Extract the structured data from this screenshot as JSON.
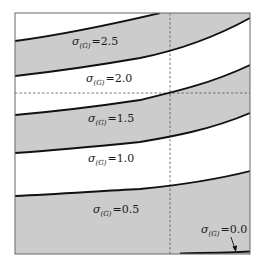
{
  "figure": {
    "frame": {
      "left": 15,
      "top": 13,
      "right": 250,
      "bottom": 254
    },
    "colors": {
      "shade": "#cccccc",
      "curve": "#111111",
      "frame": "#666666",
      "dash": "#555555",
      "background": "#ffffff"
    },
    "dashed_lines": {
      "vertical_x": 170,
      "horizontal_y": 93
    },
    "curves": [
      {
        "name": "curve-sigma-3.0",
        "points": "15,41 60,35 100,27 130,21 160,13"
      },
      {
        "name": "curve-sigma-2.5",
        "points": "15,76 60,71 100,65 140,58 170,52 210,40 250,18"
      },
      {
        "name": "curve-sigma-2.0",
        "points": "15,115 60,111 100,106 140,100 170,93 210,84 250,65"
      },
      {
        "name": "curve-sigma-1.5",
        "points": "15,153 60,150 100,146 140,142 170,137 210,130 250,113"
      },
      {
        "name": "curve-sigma-1.0",
        "points": "15,196 60,194 100,191 140,189 170,186 210,181 250,171"
      },
      {
        "name": "curve-sigma-0.0",
        "points": "180,253 220,252.5 250,251"
      }
    ],
    "bands": [
      {
        "name": "band-top-white",
        "fill": "white"
      },
      {
        "name": "band-2.5",
        "fill": "shade"
      },
      {
        "name": "band-2.0",
        "fill": "white"
      },
      {
        "name": "band-1.5",
        "fill": "shade"
      },
      {
        "name": "band-1.0",
        "fill": "white"
      },
      {
        "name": "band-0.5",
        "fill": "shade"
      }
    ],
    "labels": [
      {
        "symbol": "σ",
        "subscript": "(G)",
        "eq": "=2.5",
        "x": 72,
        "y": 43
      },
      {
        "symbol": "σ",
        "subscript": "(G)",
        "eq": "=2.0",
        "x": 86,
        "y": 79
      },
      {
        "symbol": "σ",
        "subscript": "(G)",
        "eq": "=1.5",
        "x": 88,
        "y": 120
      },
      {
        "symbol": "σ",
        "subscript": "(G)",
        "eq": "=1.0",
        "x": 88,
        "y": 160
      },
      {
        "symbol": "σ",
        "subscript": "(G)",
        "eq": "=0.5",
        "x": 93,
        "y": 202
      },
      {
        "symbol": "σ",
        "subscript": "(G)",
        "eq": "=0.0",
        "x": 201,
        "y": 224
      }
    ],
    "arrow": {
      "from": "234,238",
      "to": "236,250"
    }
  }
}
